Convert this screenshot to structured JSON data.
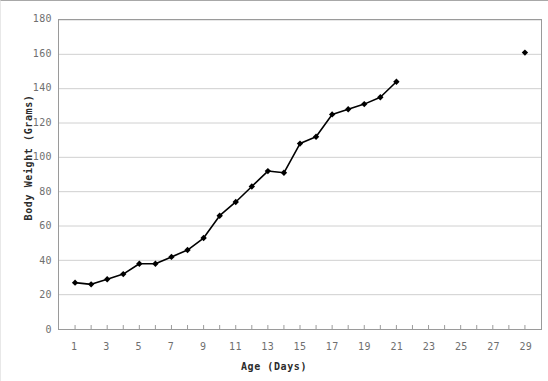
{
  "chart_data": {
    "type": "line",
    "title": "",
    "xlabel": "Age (Days)",
    "ylabel": "Body Weight (Grams)",
    "xlim": [
      0,
      30
    ],
    "ylim": [
      0,
      180
    ],
    "ytick_step": 20,
    "yticks": [
      0,
      20,
      40,
      60,
      80,
      100,
      120,
      140,
      160,
      180
    ],
    "ytick_labels": [
      "0",
      "20",
      "40",
      "60",
      "80",
      "100",
      "120",
      "140",
      "160",
      "180"
    ],
    "xticks": [
      1,
      2,
      3,
      4,
      5,
      6,
      7,
      8,
      9,
      10,
      11,
      12,
      13,
      14,
      15,
      16,
      17,
      18,
      19,
      20,
      21,
      22,
      23,
      24,
      25,
      26,
      27,
      28,
      29
    ],
    "xtick_labels_shown": [
      "1",
      "3",
      "5",
      "7",
      "9",
      "11",
      "13",
      "15",
      "17",
      "19",
      "21",
      "23",
      "25",
      "27",
      "29"
    ],
    "grid": "horizontal",
    "legend": "none",
    "marker": "diamond",
    "marker_color": "#000000",
    "line_color": "#000000",
    "grid_color": "#d0d0d0",
    "axis_color": "#9a9a9a",
    "series": [
      {
        "name": "Body Weight",
        "connected": true,
        "x": [
          1,
          2,
          3,
          4,
          5,
          6,
          7,
          8,
          9,
          10,
          11,
          12,
          13,
          14,
          15,
          16,
          17,
          18,
          19,
          20,
          21
        ],
        "values": [
          27,
          26,
          29,
          32,
          38,
          38,
          42,
          46,
          53,
          66,
          74,
          83,
          92,
          91,
          108,
          112,
          125,
          128,
          131,
          135,
          144
        ]
      },
      {
        "name": "Body Weight (isolated point)",
        "connected": false,
        "x": [
          29
        ],
        "values": [
          161
        ]
      }
    ]
  }
}
